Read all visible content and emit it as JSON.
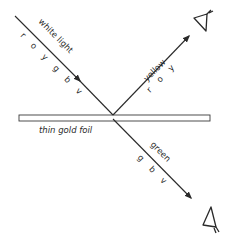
{
  "diagram": {
    "incident": {
      "label": "white light",
      "colors": "r o y g b v"
    },
    "reflected": {
      "label": "yellow",
      "colors": "r o y"
    },
    "transmitted": {
      "label": "green",
      "colors": "g b v"
    },
    "foil": {
      "label": "thin gold foil"
    },
    "colors": {
      "ink": "#2a2a2a",
      "background": "#ffffff"
    }
  }
}
